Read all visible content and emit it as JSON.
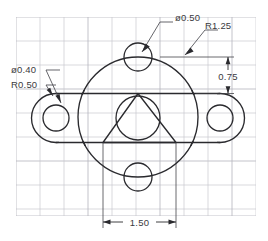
{
  "drawing": {
    "title": "Mechanical Part Orthographic Sketch",
    "background_color": "#ffffff",
    "line_color": "#2a2a2e",
    "grid_color": "#c9c9cf",
    "units_implied": "inches",
    "annotations": [
      {
        "id": "top-hole-dia",
        "label": "ø0.50",
        "type": "diameter",
        "value": 0.5,
        "describes": "upper-hole",
        "text_x": 178,
        "text_y": 18
      },
      {
        "id": "body-radius",
        "label": "R1.25",
        "type": "radius",
        "value": 1.25,
        "describes": "main-body-circle",
        "text_x": 207,
        "text_y": 26
      },
      {
        "id": "side-hole-dia",
        "label": "ø0.40",
        "type": "diameter",
        "value": 0.4,
        "describes": "left-side-hole",
        "text_x": 13,
        "text_y": 72
      },
      {
        "id": "lobe-radius",
        "label": "R0.50",
        "type": "radius",
        "value": 0.5,
        "describes": "left-lobe-end-radius",
        "text_x": 13,
        "text_y": 87
      },
      {
        "id": "vertical-offset",
        "label": "0.75",
        "type": "linear-vertical",
        "value": 0.75,
        "describes": "distance-from-hole-center-to-bar-top",
        "text_x": 228,
        "text_y": 79
      },
      {
        "id": "horizontal-width",
        "label": "1.50",
        "type": "linear-horizontal",
        "value": 1.5,
        "describes": "triangle-base-width",
        "text_x": 139,
        "text_y": 226
      }
    ],
    "grid": {
      "left": 16,
      "top": 17,
      "right": 256,
      "bottom": 216,
      "spacing": 24,
      "visible": true
    },
    "geometry": {
      "main_body": {
        "cx": 138,
        "cy": 117,
        "r": 60
      },
      "upper_hole": {
        "cx": 138,
        "cy": 57,
        "r": 14
      },
      "lower_hole": {
        "cx": 138,
        "cy": 177,
        "r": 14
      },
      "center_hole": {
        "cx": 138,
        "cy": 118,
        "r": 22
      },
      "left_hole": {
        "cx": 56,
        "cy": 118,
        "r": 13
      },
      "right_hole": {
        "cx": 220,
        "cy": 118,
        "r": 13
      },
      "left_lobe": {
        "cx": 56,
        "cy": 118,
        "r": 24.5
      },
      "right_lobe": {
        "cx": 220,
        "cy": 118,
        "r": 24.5
      },
      "bar": {
        "x1": 56,
        "x2": 220,
        "y_top": 93.5,
        "y_bottom": 142.5
      },
      "triangle": {
        "apex_x": 138,
        "apex_y": 93.5,
        "base_y": 142.5,
        "base_x1": 103,
        "base_x2": 176
      }
    }
  }
}
